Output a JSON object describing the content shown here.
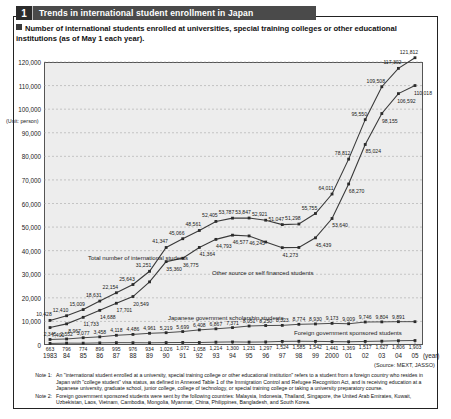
{
  "header": {
    "number": "1",
    "title": "Trends in international student enrollment in Japan",
    "subtitle": "Number of international students enrolled at universities, special training colleges or other educational institutions (as of May 1 each year)."
  },
  "source": "(Source: MEXT, JASSO)",
  "notes": [
    {
      "tag": "Note 1:",
      "text": "An \"international student enrolled at a university, special training college or other educational institution\" refers to a student from a foreign country who resides in Japan with \"college student\" visa status, as defined in Annexed Table 1 of the Immigration Control and Refugee Recognition Act, and is receiving education at a Japanese university, graduate school, junior college, college of technology, or special training college or taking a university preparatory course."
    },
    {
      "tag": "Note 2:",
      "text": "Foreign government sponsored students were sent by the following countries: Malaysia, Indonesia, Thailand, Singapore, the United Arab Emirates, Kuwait, Uzbekistan, Laos, Vietnam, Cambodia, Mongolia, Myanmar, China, Philippines, Bangladesh, and South Korea."
    }
  ],
  "axis": {
    "unit_label": "(Unit: person)",
    "year_suffix": "(year)",
    "y_ticks": [
      "120,000",
      "110,000",
      "100,000",
      "90,000",
      "80,000",
      "70,000",
      "60,000",
      "50,000",
      "40,000",
      "30,000",
      "20,000",
      "10,000",
      "0"
    ]
  },
  "series_labels": {
    "total": "Total number of international students",
    "other": "Other source or self financed students",
    "japanese_gov": "Japanese government scholarship students",
    "foreign_gov": "Foreign government sponsored students"
  },
  "colors": {
    "banner": "#4a4a4a",
    "banner_num": "#2b2b2b",
    "plot_bg": "#ededed",
    "line": "#3a3a3a",
    "grid": "#9a9a9a",
    "frame": "#222222"
  },
  "chart_data": {
    "type": "line",
    "title": "Trends in international student enrollment in Japan",
    "xlabel": "(year)",
    "ylabel": "(Unit: person)",
    "ylim": [
      0,
      120000
    ],
    "grid": true,
    "legend": "inline-annotations",
    "categories": [
      "1983",
      "84",
      "85",
      "86",
      "87",
      "88",
      "89",
      "90",
      "91",
      "92",
      "93",
      "94",
      "95",
      "96",
      "97",
      "98",
      "99",
      "2000",
      "01",
      "02",
      "03",
      "04",
      "05"
    ],
    "series": [
      {
        "name": "Total number of international students",
        "values": [
          10428,
          12410,
          15009,
          18631,
          22154,
          25643,
          31251,
          41347,
          45066,
          48561,
          52405,
          53787,
          53847,
          52921,
          51047,
          51298,
          55755,
          64011,
          78812,
          95550,
          109508,
          117302,
          121812
        ]
      },
      {
        "name": "Other source or self financed students",
        "values": [
          7400,
          8967,
          11733,
          14688,
          17701,
          20549,
          26770,
          35360,
          36775,
          41364,
          44793,
          46577,
          46245,
          43673,
          41273,
          41360,
          45439,
          53640,
          68270,
          85024,
          98155,
          106592,
          110018
        ]
      },
      {
        "name": "Japanese government scholarship students",
        "values": [
          2345,
          2552,
          3077,
          3458,
          4118,
          4486,
          4961,
          5219,
          5699,
          6408,
          6867,
          7371,
          8051,
          8250,
          8323,
          8774,
          8930,
          9173,
          9009,
          9746,
          9804,
          9891,
          9891
        ]
      },
      {
        "name": "Foreign government sponsored students",
        "values": [
          663,
          796,
          774,
          896,
          995,
          976,
          934,
          1026,
          1072,
          1058,
          1214,
          1300,
          1231,
          1297,
          1524,
          1585,
          1542,
          1441,
          1369,
          1517,
          1627,
          1806,
          1903
        ]
      }
    ],
    "point_labels": {
      "total": [
        {
          "year": "1983",
          "v": "10,428"
        },
        {
          "year": "84",
          "v": "12,410"
        },
        {
          "year": "85",
          "v": "15,009"
        },
        {
          "year": "86",
          "v": "18,631"
        },
        {
          "year": "87",
          "v": "22,154"
        },
        {
          "year": "88",
          "v": "25,643"
        },
        {
          "year": "89",
          "v": "31,251"
        },
        {
          "year": "90",
          "v": "41,347"
        },
        {
          "year": "91",
          "v": "45,066"
        },
        {
          "year": "92",
          "v": "48,561"
        },
        {
          "year": "93",
          "v": "52,405"
        },
        {
          "year": "94",
          "v": "53,787"
        },
        {
          "year": "95",
          "v": "53,847"
        },
        {
          "year": "96",
          "v": "52,921"
        },
        {
          "year": "97",
          "v": "51,047"
        },
        {
          "year": "98",
          "v": "51,298"
        },
        {
          "year": "99",
          "v": "55,755"
        },
        {
          "year": "2000",
          "v": "64,011"
        },
        {
          "year": "01",
          "v": "78,812"
        },
        {
          "year": "02",
          "v": "95,550"
        },
        {
          "year": "03",
          "v": "109,508"
        },
        {
          "year": "04",
          "v": "117,302"
        },
        {
          "year": "05",
          "v": "121,812"
        }
      ],
      "other": [
        {
          "year": "1983",
          "v": "7,400"
        },
        {
          "year": "84",
          "v": "8,967"
        },
        {
          "year": "85",
          "v": "11,733"
        },
        {
          "year": "86",
          "v": "14,688"
        },
        {
          "year": "87",
          "v": "17,701"
        },
        {
          "year": "88",
          "v": "20,549"
        },
        {
          "year": "90",
          "v": "35,360"
        },
        {
          "year": "91",
          "v": "36,775"
        },
        {
          "year": "92",
          "v": "41,364"
        },
        {
          "year": "93",
          "v": "44,793"
        },
        {
          "year": "94",
          "v": "46,577"
        },
        {
          "year": "95",
          "v": "46,245"
        },
        {
          "year": "97",
          "v": "41,273"
        },
        {
          "year": "99",
          "v": "45,439"
        },
        {
          "year": "2000",
          "v": "53,640"
        },
        {
          "year": "01",
          "v": "68,270"
        },
        {
          "year": "02",
          "v": "85,024"
        },
        {
          "year": "03",
          "v": "98,155"
        },
        {
          "year": "04",
          "v": "106,592"
        },
        {
          "year": "05",
          "v": "110,018"
        }
      ],
      "japanese_gov": [
        {
          "year": "1983",
          "v": "2,345"
        },
        {
          "year": "84",
          "v": "2,552"
        },
        {
          "year": "85",
          "v": "3,077"
        },
        {
          "year": "86",
          "v": "3,458"
        },
        {
          "year": "87",
          "v": "4,118"
        },
        {
          "year": "88",
          "v": "4,486"
        },
        {
          "year": "89",
          "v": "4,961"
        },
        {
          "year": "90",
          "v": "5,219"
        },
        {
          "year": "91",
          "v": "5,699"
        },
        {
          "year": "92",
          "v": "6,408"
        },
        {
          "year": "93",
          "v": "6,867"
        },
        {
          "year": "94",
          "v": "7,371"
        },
        {
          "year": "95",
          "v": "8,051"
        },
        {
          "year": "96",
          "v": "8,250"
        },
        {
          "year": "97",
          "v": "8,323"
        },
        {
          "year": "98",
          "v": "8,774"
        },
        {
          "year": "99",
          "v": "8,930"
        },
        {
          "year": "2000",
          "v": "9,173"
        },
        {
          "year": "01",
          "v": "9,009"
        },
        {
          "year": "02",
          "v": "9,746"
        },
        {
          "year": "03",
          "v": "9,804"
        },
        {
          "year": "04",
          "v": "9,891"
        }
      ],
      "foreign_gov": [
        {
          "year": "1983",
          "v": "663"
        },
        {
          "year": "84",
          "v": "796"
        },
        {
          "year": "85",
          "v": "774"
        },
        {
          "year": "86",
          "v": "896"
        },
        {
          "year": "87",
          "v": "995"
        },
        {
          "year": "88",
          "v": "976"
        },
        {
          "year": "89",
          "v": "934"
        },
        {
          "year": "90",
          "v": "1,026"
        },
        {
          "year": "91",
          "v": "1,072"
        },
        {
          "year": "92",
          "v": "1,058"
        },
        {
          "year": "93",
          "v": "1,214"
        },
        {
          "year": "94",
          "v": "1,300"
        },
        {
          "year": "95",
          "v": "1,231"
        },
        {
          "year": "96",
          "v": "1,297"
        },
        {
          "year": "97",
          "v": "1,524"
        },
        {
          "year": "98",
          "v": "1,585"
        },
        {
          "year": "99",
          "v": "1,542"
        },
        {
          "year": "2000",
          "v": "1,441"
        },
        {
          "year": "01",
          "v": "1,369"
        },
        {
          "year": "02",
          "v": "1,517"
        },
        {
          "year": "03",
          "v": "1,627"
        },
        {
          "year": "04",
          "v": "1,806"
        },
        {
          "year": "05",
          "v": "1,903"
        }
      ]
    }
  }
}
